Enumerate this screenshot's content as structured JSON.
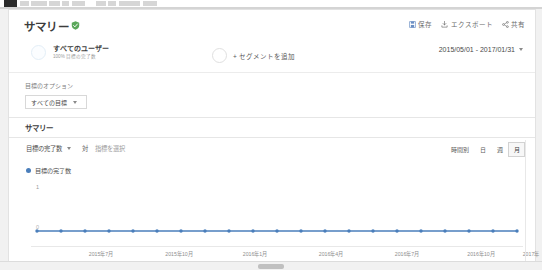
{
  "header": {
    "page_title": "サマリー",
    "shield_icon": "shield-check-icon",
    "actions": [
      {
        "icon": "save-icon",
        "label": "保存"
      },
      {
        "icon": "export-icon",
        "label": "エクスポート"
      },
      {
        "icon": "share-icon",
        "label": "共有"
      }
    ],
    "date_range": "2015/05/01 - 2017/01/31"
  },
  "segments": {
    "all_users": {
      "name": "すべてのユーザー",
      "sub": "100% 目標の完了数"
    },
    "add_segment_label": "+ セグメントを追加"
  },
  "goal_options": {
    "label": "目標のオプション",
    "selected": "すべての目標"
  },
  "tabs": [
    {
      "label": "サマリー",
      "active": true
    }
  ],
  "metric_row": {
    "primary_metric": "目標の完了数",
    "vs_label": "対",
    "secondary_metric": "指標を選択",
    "granularity": [
      {
        "label": "時間別",
        "active": false
      },
      {
        "label": "日",
        "active": false
      },
      {
        "label": "週",
        "active": false
      },
      {
        "label": "月",
        "active": true
      }
    ]
  },
  "chart_data": {
    "type": "line",
    "title": "目標の完了数",
    "legend": [
      "目標の完了数"
    ],
    "legend_position": "top-left",
    "xlabel": "",
    "ylabel": "",
    "ylim": [
      0,
      1
    ],
    "yticks": [
      "1",
      "0"
    ],
    "grid": false,
    "line_color": "#4a7ebb",
    "x": [
      "2015年5月",
      "2015年6月",
      "2015年7月",
      "2015年8月",
      "2015年9月",
      "2015年10月",
      "2015年11月",
      "2015年12月",
      "2016年1月",
      "2016年2月",
      "2016年3月",
      "2016年4月",
      "2016年5月",
      "2016年6月",
      "2016年7月",
      "2016年8月",
      "2016年9月",
      "2016年10月",
      "2016年11月",
      "2016年12月",
      "2017年1月"
    ],
    "values": [
      0,
      0,
      0,
      0,
      0,
      0,
      0,
      0,
      0,
      0,
      0,
      0,
      0,
      0,
      0,
      0,
      0,
      0,
      0,
      0,
      0
    ],
    "xtick_labels": [
      "2015年7月",
      "2015年10月",
      "2016年1月",
      "2016年4月",
      "2016年7月",
      "2016年10月",
      "2017年"
    ]
  }
}
